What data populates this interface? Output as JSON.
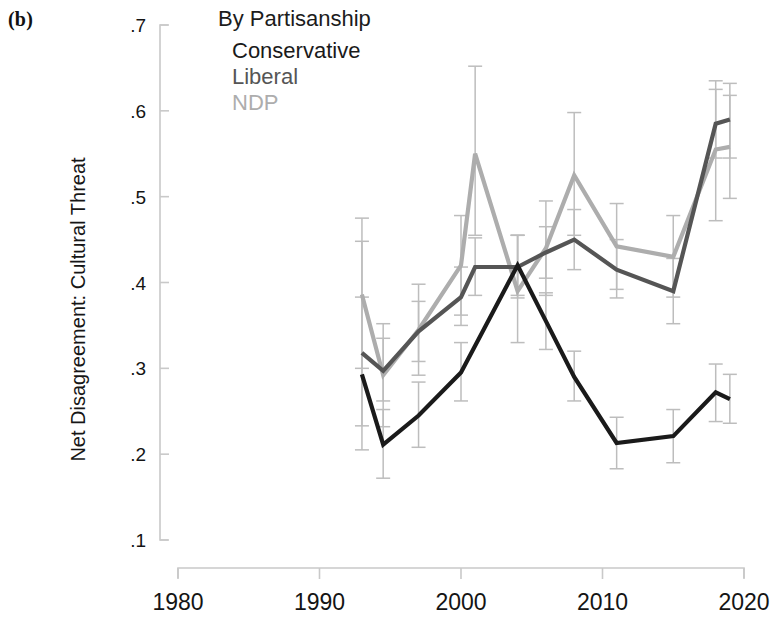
{
  "panel": {
    "label": "(b)"
  },
  "legend": {
    "title": "By Partisanship",
    "entries": [
      {
        "name": "Conservative",
        "color": "#1a1a1a"
      },
      {
        "name": "Liberal",
        "color": "#555555"
      },
      {
        "name": "NDP",
        "color": "#adadad"
      }
    ]
  },
  "axes": {
    "ylabel": "Net Disagreement: Cultural Threat",
    "xlabel": "",
    "yticks": [
      ".1",
      ".2",
      ".3",
      ".4",
      ".5",
      ".6",
      ".7"
    ],
    "xticks": [
      "1980",
      "1990",
      "2000",
      "2010",
      "2020"
    ]
  },
  "chart_data": {
    "type": "line",
    "title": "By Partisanship",
    "xlabel": "",
    "ylabel": "Net Disagreement: Cultural Threat",
    "xlim": [
      1976,
      1921.5
    ],
    "x_range": [
      1976,
      2022
    ],
    "ylim": [
      0.1,
      0.7
    ],
    "grid": false,
    "legend_position": "top-right",
    "error_bars": true,
    "ytick_values": [
      0.1,
      0.2,
      0.3,
      0.4,
      0.5,
      0.6,
      0.7
    ],
    "xtick_values": [
      1980,
      1990,
      2000,
      2010,
      2020
    ],
    "series": [
      {
        "name": "Conservative",
        "color": "#1a1a1a",
        "x": [
          1993,
          1994.5,
          1997,
          2000,
          2004,
          2006,
          2008,
          2011,
          2015,
          2018,
          2019
        ],
        "y": [
          0.293,
          0.211,
          0.245,
          0.295,
          0.42,
          0.355,
          0.29,
          0.213,
          0.221,
          0.272,
          0.264
        ],
        "ci_low": [
          0.205,
          0.172,
          0.208,
          0.262,
          0.385,
          0.322,
          0.262,
          0.183,
          0.19,
          0.238,
          0.236
        ],
        "ci_high": [
          0.383,
          0.252,
          0.284,
          0.33,
          0.455,
          0.388,
          0.32,
          0.243,
          0.252,
          0.305,
          0.293
        ]
      },
      {
        "name": "Liberal",
        "color": "#555555",
        "x": [
          1993,
          1994.5,
          1997,
          2000,
          2001,
          2004,
          2006,
          2008,
          2011,
          2015,
          2018,
          2019
        ],
        "y": [
          0.318,
          0.297,
          0.343,
          0.383,
          0.418,
          0.418,
          0.435,
          0.45,
          0.415,
          0.39,
          0.585,
          0.59
        ],
        "ci_low": [
          0.233,
          0.262,
          0.308,
          0.35,
          0.385,
          0.382,
          0.405,
          0.415,
          0.382,
          0.352,
          0.545,
          0.545
        ],
        "ci_high": [
          0.448,
          0.335,
          0.378,
          0.418,
          0.452,
          0.455,
          0.465,
          0.485,
          0.45,
          0.428,
          0.625,
          0.632
        ]
      },
      {
        "name": "NDP",
        "color": "#adadad",
        "x": [
          1993,
          1994.5,
          1997,
          2000,
          2001,
          2004,
          2006,
          2008,
          2011,
          2015,
          2018,
          2019
        ],
        "y": [
          0.386,
          0.292,
          0.345,
          0.42,
          0.55,
          0.39,
          0.44,
          0.525,
          0.442,
          0.43,
          0.555,
          0.558
        ],
        "ci_low": [
          0.3,
          0.232,
          0.292,
          0.362,
          0.455,
          0.33,
          0.385,
          0.455,
          0.392,
          0.383,
          0.472,
          0.498
        ],
        "ci_high": [
          0.475,
          0.352,
          0.398,
          0.478,
          0.652,
          0.455,
          0.495,
          0.598,
          0.492,
          0.478,
          0.635,
          0.618
        ]
      }
    ]
  }
}
